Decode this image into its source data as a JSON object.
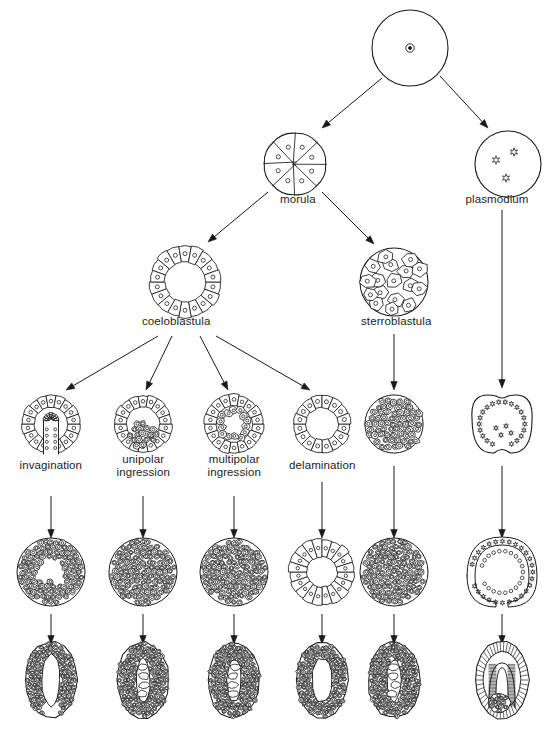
{
  "figure": {
    "stroke_color": "#1a1a1a",
    "fill_color": "#ffffff",
    "background": "#ffffff",
    "width": 553,
    "height": 746
  },
  "labels": [
    {
      "id": "morula",
      "text": "morula",
      "x": 298,
      "y": 200
    },
    {
      "id": "plasmodium",
      "text": "plasmodium",
      "x": 497,
      "y": 200
    },
    {
      "id": "coeloblastula",
      "text": "coeloblastula",
      "x": 176,
      "y": 322
    },
    {
      "id": "sterroblastula",
      "text": "sterroblastula",
      "x": 396,
      "y": 322
    },
    {
      "id": "invagination",
      "text": "invagination",
      "x": 51,
      "y": 466
    },
    {
      "id": "unipolar-ingression",
      "text": "unipolar\ningression",
      "x": 143,
      "y": 466
    },
    {
      "id": "multipolar-ingression",
      "text": "multipolar\ningression",
      "x": 234,
      "y": 466
    },
    {
      "id": "delamination",
      "text": "delamination",
      "x": 322,
      "y": 466
    }
  ],
  "stages": {
    "zygote": {
      "id": "zygote",
      "cx": 410,
      "cy": 48,
      "r": 38,
      "nuclei": 1,
      "kind": "zygote"
    },
    "morula": {
      "id": "morula",
      "cx": 295,
      "cy": 164,
      "r": 33,
      "cells": 8,
      "kind": "morula"
    },
    "plasmodium": {
      "id": "plasmodium",
      "cx": 508,
      "cy": 164,
      "r": 33,
      "nuclei": 3,
      "kind": "plasmodium"
    },
    "coeloblastula": {
      "id": "coeloblastula",
      "cx": 185,
      "cy": 282,
      "r": 37,
      "cells": 18,
      "kind": "blastula-hollow"
    },
    "sterroblastula": {
      "id": "sterroblastula",
      "cx": 394,
      "cy": 282,
      "r": 34,
      "cells": 16,
      "kind": "blastula-solid"
    }
  },
  "columns": [
    {
      "id": "invagination",
      "cx": 51,
      "label": "invagination"
    },
    {
      "id": "unipolar-ingression",
      "cx": 143,
      "label": "unipolar ingression"
    },
    {
      "id": "multipolar-ingression",
      "cx": 234,
      "label": "multipolar ingression"
    },
    {
      "id": "delamination",
      "cx": 322,
      "label": "delamination"
    },
    {
      "id": "sterroblastula-line",
      "cx": 394,
      "label": "sterroblastula"
    },
    {
      "id": "plasmodium-line",
      "cx": 502,
      "label": "plasmodium"
    }
  ],
  "rows": [
    {
      "id": "gastrulation-mode",
      "cy": 424,
      "kind": "mode"
    },
    {
      "id": "gastrula",
      "cy": 572,
      "kind": "gastrula"
    },
    {
      "id": "larva",
      "cy": 680,
      "kind": "larva"
    }
  ],
  "row_shapes": {
    "gastrulation-mode": [
      {
        "col": "invagination",
        "shape": "invaginating-ring"
      },
      {
        "col": "unipolar-ingression",
        "shape": "unipolar-ring"
      },
      {
        "col": "multipolar-ingression",
        "shape": "multipolar-ring"
      },
      {
        "col": "delamination",
        "shape": "plain-ring"
      },
      {
        "col": "sterroblastula-line",
        "shape": "solid-mass"
      },
      {
        "col": "plasmodium-line",
        "shape": "plasmodium-cleft"
      }
    ],
    "gastrula": [
      {
        "col": "invagination",
        "shape": "c-cavity-mass"
      },
      {
        "col": "unipolar-ingression",
        "shape": "dense-mass"
      },
      {
        "col": "multipolar-ingression",
        "shape": "dense-mass"
      },
      {
        "col": "delamination",
        "shape": "ring-cavity-mass"
      },
      {
        "col": "sterroblastula-line",
        "shape": "dense-mass"
      },
      {
        "col": "plasmodium-line",
        "shape": "c-double-layer"
      }
    ],
    "larva": [
      {
        "col": "invagination",
        "shape": "larva-open"
      },
      {
        "col": "unipolar-ingression",
        "shape": "larva-lumen"
      },
      {
        "col": "multipolar-ingression",
        "shape": "larva-lumen"
      },
      {
        "col": "delamination",
        "shape": "larva-oval"
      },
      {
        "col": "sterroblastula-line",
        "shape": "larva-lumen"
      },
      {
        "col": "plasmodium-line",
        "shape": "larva-folded"
      }
    ]
  },
  "arrows": [
    {
      "id": "zygote-to-morula",
      "x1": 382,
      "y1": 78,
      "x2": 322,
      "y2": 128
    },
    {
      "id": "zygote-to-plasmodium",
      "x1": 440,
      "y1": 76,
      "x2": 488,
      "y2": 128
    },
    {
      "id": "morula-to-coeloblastula",
      "x1": 268,
      "y1": 192,
      "x2": 208,
      "y2": 242
    },
    {
      "id": "morula-to-sterroblastula",
      "x1": 322,
      "y1": 192,
      "x2": 374,
      "y2": 244
    },
    {
      "id": "coeloblastula-to-invagination",
      "x1": 158,
      "y1": 336,
      "x2": 66,
      "y2": 390
    },
    {
      "id": "coeloblastula-to-unipolar",
      "x1": 172,
      "y1": 336,
      "x2": 146,
      "y2": 390
    },
    {
      "id": "coeloblastula-to-multipolar",
      "x1": 200,
      "y1": 336,
      "x2": 228,
      "y2": 390
    },
    {
      "id": "coeloblastula-to-delamination",
      "x1": 216,
      "y1": 336,
      "x2": 310,
      "y2": 390
    },
    {
      "id": "sterroblastula-down",
      "x1": 394,
      "y1": 334,
      "x2": 394,
      "y2": 390
    },
    {
      "id": "plasmodium-down",
      "x1": 502,
      "y1": 210,
      "x2": 502,
      "y2": 388
    },
    {
      "id": "invagination-down",
      "x1": 51,
      "y1": 496,
      "x2": 51,
      "y2": 538
    },
    {
      "id": "unipolar-down",
      "x1": 143,
      "y1": 496,
      "x2": 143,
      "y2": 538
    },
    {
      "id": "multipolar-down",
      "x1": 234,
      "y1": 496,
      "x2": 234,
      "y2": 538
    },
    {
      "id": "delamination-down",
      "x1": 322,
      "y1": 482,
      "x2": 322,
      "y2": 538
    },
    {
      "id": "sterroblastula-mid-down",
      "x1": 394,
      "y1": 466,
      "x2": 394,
      "y2": 538
    },
    {
      "id": "plasmodium-mid-down",
      "x1": 502,
      "y1": 466,
      "x2": 502,
      "y2": 538
    },
    {
      "id": "invagination-larva",
      "x1": 51,
      "y1": 614,
      "x2": 51,
      "y2": 644
    },
    {
      "id": "unipolar-larva",
      "x1": 143,
      "y1": 614,
      "x2": 143,
      "y2": 644
    },
    {
      "id": "multipolar-larva",
      "x1": 234,
      "y1": 614,
      "x2": 234,
      "y2": 644
    },
    {
      "id": "delamination-larva",
      "x1": 322,
      "y1": 614,
      "x2": 322,
      "y2": 644
    },
    {
      "id": "sterroblastula-larva",
      "x1": 394,
      "y1": 614,
      "x2": 394,
      "y2": 644
    },
    {
      "id": "plasmodium-larva",
      "x1": 502,
      "y1": 614,
      "x2": 502,
      "y2": 644
    }
  ]
}
